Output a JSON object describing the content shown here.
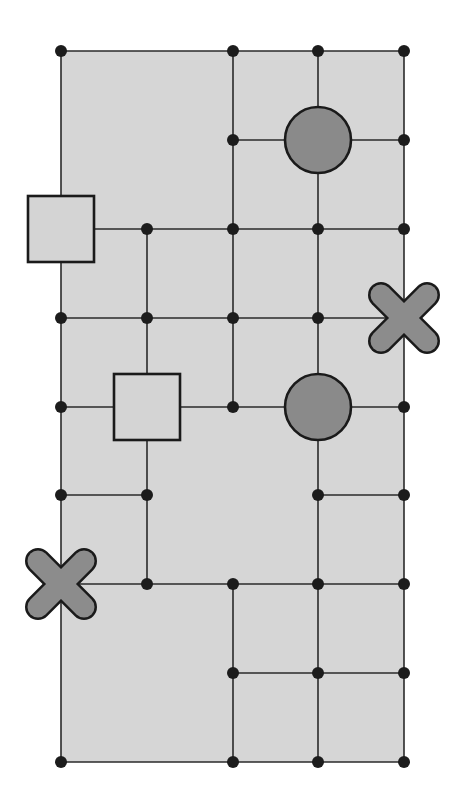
{
  "colors": {
    "background": "#ffffff",
    "board_fill": "#d6d6d6",
    "line": "#2a2a2a",
    "node": "#1c1c1c",
    "circle_fill": "#8a8a8a",
    "square_fill": "#d4d4d4",
    "cross_fill": "#8c8c8c",
    "outline": "#1a1a1a"
  },
  "grid": {
    "columns_x": [
      61,
      147,
      233,
      318,
      404
    ],
    "rows_y": [
      51,
      140,
      229,
      318,
      407,
      495,
      584,
      673,
      762
    ],
    "line_width": 1.6,
    "node_radius": 6
  },
  "board": {
    "col_from": 0,
    "row_from": 0,
    "col_to": 4,
    "row_to": 8
  },
  "horizontal_edges": [
    {
      "row": 0,
      "from": 0,
      "to": 4
    },
    {
      "row": 1,
      "from": 2,
      "to": 4
    },
    {
      "row": 2,
      "from": 0,
      "to": 4
    },
    {
      "row": 3,
      "from": 0,
      "to": 4
    },
    {
      "row": 4,
      "from": 0,
      "to": 4
    },
    {
      "row": 5,
      "from": 0,
      "to": 1
    },
    {
      "row": 5,
      "from": 3,
      "to": 4
    },
    {
      "row": 6,
      "from": 0,
      "to": 4
    },
    {
      "row": 7,
      "from": 2,
      "to": 4
    },
    {
      "row": 8,
      "from": 0,
      "to": 4
    }
  ],
  "vertical_edges": [
    {
      "col": 0,
      "from": 0,
      "to": 8
    },
    {
      "col": 1,
      "from": 2,
      "to": 6
    },
    {
      "col": 2,
      "from": 0,
      "to": 4
    },
    {
      "col": 2,
      "from": 6,
      "to": 8
    },
    {
      "col": 3,
      "from": 0,
      "to": 8
    },
    {
      "col": 4,
      "from": 0,
      "to": 8
    }
  ],
  "nodes": [
    {
      "col": 0,
      "row": 0
    },
    {
      "col": 2,
      "row": 0
    },
    {
      "col": 3,
      "row": 0
    },
    {
      "col": 4,
      "row": 0
    },
    {
      "col": 2,
      "row": 1
    },
    {
      "col": 4,
      "row": 1
    },
    {
      "col": 1,
      "row": 2
    },
    {
      "col": 2,
      "row": 2
    },
    {
      "col": 3,
      "row": 2
    },
    {
      "col": 4,
      "row": 2
    },
    {
      "col": 0,
      "row": 3
    },
    {
      "col": 1,
      "row": 3
    },
    {
      "col": 2,
      "row": 3
    },
    {
      "col": 3,
      "row": 3
    },
    {
      "col": 0,
      "row": 4
    },
    {
      "col": 2,
      "row": 4
    },
    {
      "col": 4,
      "row": 4
    },
    {
      "col": 0,
      "row": 5
    },
    {
      "col": 1,
      "row": 5
    },
    {
      "col": 3,
      "row": 5
    },
    {
      "col": 4,
      "row": 5
    },
    {
      "col": 1,
      "row": 6
    },
    {
      "col": 2,
      "row": 6
    },
    {
      "col": 3,
      "row": 6
    },
    {
      "col": 4,
      "row": 6
    },
    {
      "col": 2,
      "row": 7
    },
    {
      "col": 3,
      "row": 7
    },
    {
      "col": 4,
      "row": 7
    },
    {
      "col": 0,
      "row": 8
    },
    {
      "col": 2,
      "row": 8
    },
    {
      "col": 3,
      "row": 8
    },
    {
      "col": 4,
      "row": 8
    }
  ],
  "symbols": [
    {
      "type": "square",
      "name": "square-symbol-1",
      "col": 0,
      "row": 2,
      "size": 66
    },
    {
      "type": "square",
      "name": "square-symbol-2",
      "col": 1,
      "row": 4,
      "size": 66
    },
    {
      "type": "circle",
      "name": "circle-symbol-1",
      "col": 3,
      "row": 1,
      "radius": 33
    },
    {
      "type": "circle",
      "name": "circle-symbol-2",
      "col": 3,
      "row": 4,
      "radius": 33
    },
    {
      "type": "cross",
      "name": "cross-symbol-1",
      "col": 4,
      "row": 3,
      "size": 33
    },
    {
      "type": "cross",
      "name": "cross-symbol-2",
      "col": 0,
      "row": 6,
      "size": 33
    }
  ]
}
